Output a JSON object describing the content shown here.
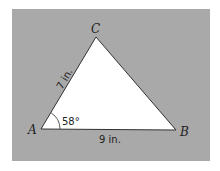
{
  "figure": {
    "panel_color": "#a9a9a9",
    "triangle_fill": "#ffffff",
    "stroke_color": "#333333",
    "vertices": {
      "A": {
        "label": "A",
        "x": 41,
        "y": 129
      },
      "B": {
        "label": "B",
        "x": 176,
        "y": 130
      },
      "C": {
        "label": "C",
        "x": 96,
        "y": 37
      }
    },
    "sides": {
      "AC": {
        "label": "7 in."
      },
      "AB": {
        "label": "9 in."
      }
    },
    "angle_A": {
      "label": "58°"
    }
  }
}
